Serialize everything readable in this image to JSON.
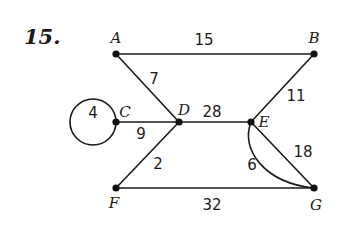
{
  "problem": {
    "number": "15."
  },
  "graph": {
    "vertices": [
      {
        "id": "A",
        "label": "A",
        "x": 116,
        "y": 54
      },
      {
        "id": "B",
        "label": "B",
        "x": 314,
        "y": 54
      },
      {
        "id": "C",
        "label": "C",
        "x": 116,
        "y": 122
      },
      {
        "id": "D",
        "label": "D",
        "x": 179,
        "y": 122
      },
      {
        "id": "E",
        "label": "E",
        "x": 251,
        "y": 122
      },
      {
        "id": "F",
        "label": "F",
        "x": 116,
        "y": 188
      },
      {
        "id": "G",
        "label": "G",
        "x": 314,
        "y": 188
      }
    ],
    "edges": [
      {
        "from": "A",
        "to": "B",
        "weight": "15"
      },
      {
        "from": "A",
        "to": "D",
        "weight": "7"
      },
      {
        "from": "C",
        "to": "C",
        "weight": "4",
        "type": "loop"
      },
      {
        "from": "C",
        "to": "D",
        "weight": "9"
      },
      {
        "from": "D",
        "to": "E",
        "weight": "28"
      },
      {
        "from": "E",
        "to": "B",
        "weight": "11"
      },
      {
        "from": "D",
        "to": "F",
        "weight": "2"
      },
      {
        "from": "E",
        "to": "G",
        "weight": "18"
      },
      {
        "from": "E",
        "to": "G",
        "weight": "6",
        "type": "curved"
      },
      {
        "from": "F",
        "to": "G",
        "weight": "32"
      }
    ]
  }
}
